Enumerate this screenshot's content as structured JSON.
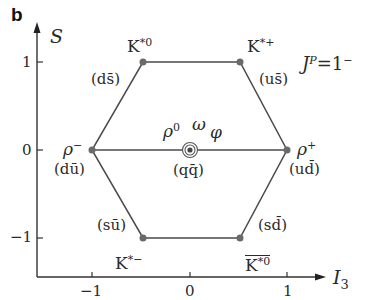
{
  "panel_label": "b",
  "title_parts": {
    "J": "J",
    "P": "P",
    "eq": "=",
    "val": "1",
    "sign": "−"
  },
  "axes": {
    "x": {
      "label_main": "I",
      "label_sub": "3",
      "ticks": [
        "−1",
        "0",
        "1"
      ]
    },
    "y": {
      "label": "S",
      "ticks": [
        "1",
        "0",
        "−1"
      ]
    }
  },
  "colors": {
    "line": "#4a4a4a",
    "dot": "#6a6a6a",
    "text": "#2a2a2a"
  },
  "mesons": [
    {
      "id": "K*0",
      "base": "K",
      "sup": "*0",
      "quark": "(ds̄)",
      "I3": -0.5,
      "S": 1
    },
    {
      "id": "K*+",
      "base": "K",
      "sup": "*+",
      "quark": "(us̄)",
      "I3": 0.5,
      "S": 1
    },
    {
      "id": "rho-",
      "base": "ρ",
      "sup": "−",
      "quark": "(dū)",
      "I3": -1,
      "S": 0
    },
    {
      "id": "rho+",
      "base": "ρ",
      "sup": "+",
      "quark": "(ud̄)",
      "I3": 1,
      "S": 0
    },
    {
      "id": "K*-",
      "base": "K",
      "sup": "*−",
      "quark": "(sū)",
      "I3": -0.5,
      "S": -1
    },
    {
      "id": "antiK*0",
      "base": "K",
      "sup": "*0",
      "quark": "(sd̄)",
      "I3": 0.5,
      "S": -1,
      "overline": true
    },
    {
      "id": "center",
      "labels": [
        "ρ0",
        "ω",
        "φ"
      ],
      "quark": "(qq̄)",
      "I3": 0,
      "S": 0
    }
  ],
  "labels": {
    "k0": {
      "base": "K",
      "sup": "*0",
      "quark": "(ds̄)"
    },
    "kplus": {
      "base": "K",
      "sup": "*+",
      "quark": "(us̄)"
    },
    "rhominus": {
      "base": "ρ",
      "sup": "−",
      "quark": "(dū)"
    },
    "rhoplus": {
      "base": "ρ",
      "sup": "+",
      "quark": "(ud̄)"
    },
    "kminus": {
      "base": "K",
      "sup": "*−",
      "quark": "(sū)"
    },
    "k0bar": {
      "base": "K",
      "sup": "*0",
      "quark": "(sd̄)"
    },
    "center": {
      "rho0_base": "ρ",
      "rho0_sup": "0",
      "omega": "ω",
      "phi": "φ",
      "quark": "(qq̄)"
    }
  }
}
